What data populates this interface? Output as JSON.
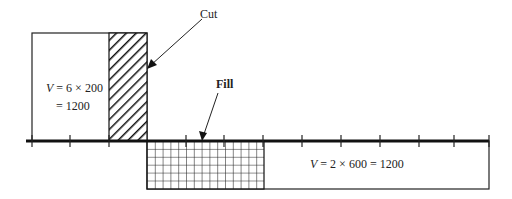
{
  "diagram": {
    "labels": {
      "cut": "Cut",
      "fill": "Fill"
    },
    "upper_block": {
      "var": "V",
      "expr_line1": " = 6 × 200",
      "expr_line2": "= 1200"
    },
    "lower_block": {
      "var": "V",
      "expr": " = 2 × 600 = 1200"
    },
    "colors": {
      "line": "#1a1a1a",
      "background": "#ffffff"
    }
  }
}
